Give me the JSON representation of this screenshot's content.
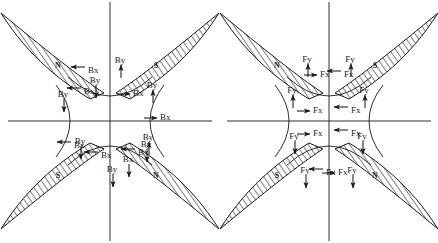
{
  "figure": {
    "title": "",
    "background_color": "#ffffff",
    "ink_color": "#1a1a1a",
    "width": 438,
    "height": 243,
    "panel_count": 2
  },
  "panels": [
    {
      "id": "left-panel",
      "name": "magnetic-flux-density-components",
      "component_prefix": "B",
      "center": {
        "x": 110,
        "y": 121
      },
      "axes": {
        "vertical_label": "",
        "horizontal_label": "",
        "vertical_x": 110,
        "horizontal_y": 121
      },
      "poles": [
        {
          "position": "top-left",
          "label": "N"
        },
        {
          "position": "top-right",
          "label": "S"
        },
        {
          "position": "bottom-left",
          "label": "S"
        },
        {
          "position": "bottom-right",
          "label": "N"
        }
      ],
      "arrow_labels": [
        {
          "id": "l-a1",
          "text": "Bx",
          "x": 82,
          "y": 70,
          "dir": "left"
        },
        {
          "id": "l-a2",
          "text": "By",
          "x": 120,
          "y": 63,
          "dir": "up"
        },
        {
          "id": "l-a3",
          "text": "Bx",
          "x": 78,
          "y": 91,
          "dir": "left"
        },
        {
          "id": "l-a4",
          "text": "By",
          "x": 95,
          "y": 96,
          "dir": "down"
        },
        {
          "id": "l-a5",
          "text": "Bx",
          "x": 133,
          "y": 93,
          "dir": "right"
        },
        {
          "id": "l-a6",
          "text": "By",
          "x": 152,
          "y": 88,
          "dir": "up"
        },
        {
          "id": "l-a7",
          "text": "By",
          "x": 63,
          "y": 110,
          "dir": "down"
        },
        {
          "id": "l-a8",
          "text": "Bx",
          "x": 160,
          "y": 117,
          "dir": "right"
        },
        {
          "id": "l-a9",
          "text": "Bx",
          "x": 68,
          "y": 145,
          "dir": "left"
        },
        {
          "id": "l-a10",
          "text": "By",
          "x": 148,
          "y": 140,
          "dir": "up"
        },
        {
          "id": "l-a11",
          "text": "By",
          "x": 80,
          "y": 157,
          "dir": "down"
        },
        {
          "id": "l-a12",
          "text": "Bx",
          "x": 95,
          "y": 155,
          "dir": "left"
        },
        {
          "id": "l-a13",
          "text": "Bx",
          "x": 132,
          "y": 152,
          "dir": "left"
        },
        {
          "id": "l-a14",
          "text": "By",
          "x": 146,
          "y": 160,
          "dir": "down"
        },
        {
          "id": "l-a15",
          "text": "By",
          "x": 112,
          "y": 185,
          "dir": "down"
        },
        {
          "id": "l-a16",
          "text": "Bx",
          "x": 128,
          "y": 175,
          "dir": "down"
        }
      ]
    },
    {
      "id": "right-panel",
      "name": "magnetic-force-components",
      "component_prefix": "F",
      "center": {
        "x": 329,
        "y": 121
      },
      "axes": {
        "vertical_label": "",
        "horizontal_label": "",
        "vertical_x": 329,
        "horizontal_y": 121
      },
      "poles": [
        {
          "position": "top-left",
          "label": "N"
        },
        {
          "position": "top-right",
          "label": "S"
        },
        {
          "position": "bottom-left",
          "label": "S"
        },
        {
          "position": "bottom-right",
          "label": "N"
        }
      ],
      "arrow_labels": [
        {
          "id": "r-a1",
          "text": "Fy",
          "x": 307,
          "y": 62,
          "dir": "up"
        },
        {
          "id": "r-a2",
          "text": "Fx",
          "x": 320,
          "y": 74,
          "dir": "right"
        },
        {
          "id": "r-a3",
          "text": "Fy",
          "x": 350,
          "y": 62,
          "dir": "up"
        },
        {
          "id": "r-a4",
          "text": "Fx",
          "x": 338,
          "y": 74,
          "dir": "left"
        },
        {
          "id": "r-a5",
          "text": "Fy",
          "x": 292,
          "y": 93,
          "dir": "up"
        },
        {
          "id": "r-a6",
          "text": "Fy",
          "x": 364,
          "y": 93,
          "dir": "up"
        },
        {
          "id": "r-a7",
          "text": "Fx",
          "x": 313,
          "y": 110,
          "dir": "right"
        },
        {
          "id": "r-a8",
          "text": "Fx",
          "x": 345,
          "y": 110,
          "dir": "left"
        },
        {
          "id": "r-a9",
          "text": "Fx",
          "x": 313,
          "y": 133,
          "dir": "right"
        },
        {
          "id": "r-a10",
          "text": "Fx",
          "x": 345,
          "y": 133,
          "dir": "left"
        },
        {
          "id": "r-a11",
          "text": "Fy",
          "x": 294,
          "y": 152,
          "dir": "down"
        },
        {
          "id": "r-a12",
          "text": "Fy",
          "x": 362,
          "y": 152,
          "dir": "down"
        },
        {
          "id": "r-a13",
          "text": "Fx",
          "x": 320,
          "y": 172,
          "dir": "left"
        },
        {
          "id": "r-a14",
          "text": "Fx",
          "x": 338,
          "y": 172,
          "dir": "right"
        },
        {
          "id": "r-a15",
          "text": "Fy",
          "x": 305,
          "y": 186,
          "dir": "down"
        },
        {
          "id": "r-a16",
          "text": "Fy",
          "x": 352,
          "y": 186,
          "dir": "down"
        }
      ]
    }
  ]
}
